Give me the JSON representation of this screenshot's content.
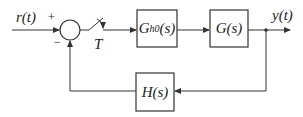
{
  "diagram": {
    "type": "sampled-data feedback control block diagram",
    "input_label": "r(t)",
    "output_label": "y(t)",
    "summing_junction": {
      "plus_sign": "+",
      "minus_sign": "−"
    },
    "sampler": {
      "label": "T"
    },
    "blocks": [
      {
        "id": "zoh",
        "label_main": "G",
        "label_sub": "h0",
        "label_tail": "(s)"
      },
      {
        "id": "plant",
        "label": "G(s)"
      },
      {
        "id": "feedback",
        "label": "H(s)"
      }
    ],
    "colors": {
      "line": "#333333",
      "background": "#ffffff"
    }
  }
}
